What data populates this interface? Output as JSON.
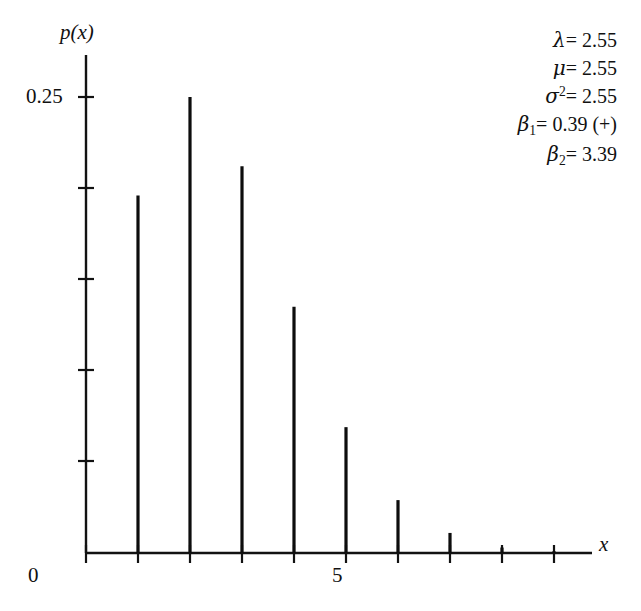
{
  "chart_data": {
    "type": "bar",
    "title": "",
    "subtitle": "",
    "xlabel": "x",
    "ylabel": "p(x)",
    "categories": [
      1,
      2,
      3,
      4,
      5,
      6,
      7,
      8,
      9
    ],
    "values": [
      0.196,
      0.25,
      0.212,
      0.135,
      0.069,
      0.029,
      0.011,
      0.003,
      0.001
    ],
    "x": [
      1,
      2,
      3,
      4,
      5,
      6,
      7,
      8,
      9
    ],
    "xlim": [
      0,
      9.7
    ],
    "ylim": [
      0,
      0.2675
    ],
    "grid": false,
    "legend": null,
    "x_tick_labels": [
      "0",
      "5"
    ],
    "x_tick_values": [
      0,
      5
    ],
    "y_tick_labels": [
      "0.25"
    ],
    "y_tick_values": [
      0.25
    ],
    "y_minor_ticks": [
      0.05,
      0.1,
      0.15,
      0.2
    ],
    "annotations": [
      "λ = 2.55",
      "μ = 2.55",
      "σ² = 2.55",
      "β₁ = 0.39 (+)",
      "β₂ = 3.39"
    ],
    "series_color": "#0d0d0d"
  },
  "axes": {
    "y_title": "p(x)",
    "x_title": "x",
    "y_tick_025": "0.25",
    "x_tick_0": "0",
    "x_tick_5": "5"
  },
  "stats": {
    "lambda_symbol": "λ",
    "lambda_value": "= 2.55",
    "mu_symbol": "μ",
    "mu_value": "= 2.55",
    "sigma_symbol": "σ",
    "sigma_exponent": "2",
    "sigma_value": "= 2.55",
    "beta1_symbol": "β",
    "beta1_subscript": "1",
    "beta1_value": "= 0.39 (+)",
    "beta2_symbol": "β",
    "beta2_subscript": "2",
    "beta2_value": "= 3.39"
  }
}
